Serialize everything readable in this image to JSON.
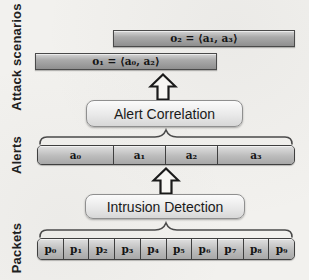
{
  "figure": {
    "type": "layered-flow-diagram",
    "topic": "Intrusion detection and alert correlation pipeline"
  },
  "axis_labels": {
    "attack_scenarios": "Attack scenarios",
    "alerts": "Alerts",
    "packets": "Packets"
  },
  "scenarios": {
    "o2_label": "o₂ = ⟨a₁, a₃⟩",
    "o1_label": "o₁ = ⟨a₀, a₂⟩"
  },
  "boxes": {
    "alert_correlation": "Alert Correlation",
    "intrusion_detection": "Intrusion Detection"
  },
  "alerts": {
    "cells": [
      "a₀",
      "a₁",
      "a₂",
      "a₃"
    ]
  },
  "packets": {
    "cells": [
      "p₀",
      "p₁",
      "p₂",
      "p₃",
      "p₄",
      "p₅",
      "p₆",
      "p₇",
      "p₈",
      "p₉"
    ]
  },
  "icons": {
    "up_arrow": "block-arrow-up"
  },
  "colors": {
    "paper_background": "#f2f1ee",
    "scenario_bar_fill": "#a0a0a0",
    "cell_fill": "#bcbcbc",
    "box_fill": "#e9e9e9",
    "border_dark": "#3f3f3f",
    "text": "#1a1a1a"
  }
}
